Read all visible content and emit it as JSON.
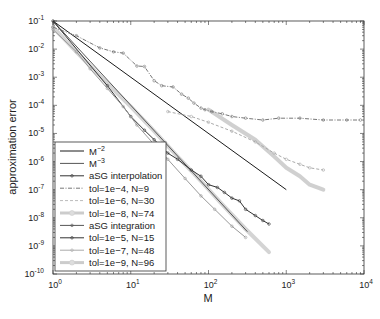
{
  "chart_data": {
    "type": "line",
    "title": "",
    "xlabel": "M",
    "ylabel": "approximation error",
    "xscale": "log",
    "yscale": "log",
    "xlim": [
      1,
      10000
    ],
    "ylim": [
      1e-10,
      0.1
    ],
    "grid": false,
    "legend_position": "lower left",
    "x_tick_labels": [
      "10^0",
      "10^1",
      "10^2",
      "10^3",
      "10^4"
    ],
    "y_tick_labels": [
      "10^-1",
      "10^-2",
      "10^-3",
      "10^-4",
      "10^-5",
      "10^-6",
      "10^-7",
      "10^-8",
      "10^-9",
      "10^-10"
    ],
    "legend": [
      "M^-2",
      "M^-3",
      "aSG interpolation",
      "tol=1e-4, N=9",
      "tol=1e-6, N=30",
      "tol=1e-8, N=74",
      "aSG integration",
      "tol=1e-5, N=15",
      "tol=1e-7, N=48",
      "tol=1e-9, N=96"
    ],
    "series": [
      {
        "name": "M^-2",
        "style": "solid",
        "color": "#1a1a1a",
        "x": [
          1,
          1000
        ],
        "y": [
          0.1,
          1e-07
        ]
      },
      {
        "name": "M^-3",
        "style": "solid",
        "color": "#555555",
        "x": [
          1,
          316
        ],
        "y": [
          0.1,
          3.2e-09
        ]
      },
      {
        "name": "aSG interpolation tol=1e-4, N=9",
        "style": "dashdot-markers",
        "color": "#777777",
        "x": [
          1,
          2,
          4,
          6,
          8,
          12,
          15,
          20,
          25,
          35,
          45,
          55,
          65,
          80,
          90,
          110,
          150,
          200,
          300,
          500,
          800,
          1500,
          3000,
          6000,
          9000
        ],
        "y": [
          0.06,
          0.03,
          0.011,
          0.008,
          0.0072,
          0.0025,
          0.0024,
          0.00075,
          0.0005,
          0.00045,
          0.00025,
          0.00018,
          0.00012,
          8e-05,
          7e-05,
          6e-05,
          5e-05,
          4e-05,
          3.5e-05,
          3e-05,
          3.5e-05,
          3.5e-05,
          3e-05,
          3e-05,
          3e-05
        ]
      },
      {
        "name": "aSG interpolation tol=1e-6, N=30",
        "style": "dashed-markers",
        "color": "#aaaaaa",
        "x": [
          30,
          60,
          100,
          200,
          400,
          700,
          1000,
          1500,
          2000,
          3000
        ],
        "y": [
          6e-05,
          4e-05,
          2.5e-05,
          1.2e-05,
          5e-06,
          2e-06,
          1.2e-06,
          8e-07,
          6e-07,
          5e-07
        ]
      },
      {
        "name": "aSG interpolation tol=1e-8, N=74",
        "style": "thick-light",
        "color": "#c8c8c8",
        "x": [
          100,
          200,
          400,
          700,
          1000,
          1500,
          2000,
          3000
        ],
        "y": [
          7e-05,
          2e-05,
          6e-06,
          1.5e-06,
          6e-07,
          3e-07,
          1.5e-07,
          1e-07
        ]
      },
      {
        "name": "aSG integration tol=1e-5, N=15",
        "style": "solid-markers",
        "color": "#333333",
        "x": [
          1,
          5,
          10,
          15,
          20,
          30,
          40,
          60,
          80,
          100,
          130,
          160,
          200,
          250,
          300,
          400,
          500,
          600
        ],
        "y": [
          0.1,
          0.0005,
          4e-05,
          1.3e-05,
          6e-06,
          2e-06,
          1.2e-06,
          5e-07,
          3e-07,
          1.5e-07,
          1.2e-07,
          8e-08,
          5e-08,
          4e-08,
          2e-08,
          1.2e-08,
          8e-09,
          6e-09
        ]
      },
      {
        "name": "aSG integration tol=1e-7, N=48",
        "style": "solid-markers",
        "color": "#999999",
        "x": [
          1,
          2,
          3,
          5,
          8,
          12,
          20,
          30,
          50,
          80,
          120,
          200,
          300
        ],
        "y": [
          0.05,
          0.008,
          0.002,
          0.0004,
          9e-05,
          2e-05,
          4e-06,
          1.2e-06,
          2.5e-07,
          6e-08,
          2e-08,
          5e-09,
          2e-09
        ]
      },
      {
        "name": "aSG integration tol=1e-9, N=96",
        "style": "thick-light",
        "color": "#cccccc",
        "x": [
          1,
          2,
          5,
          10,
          20,
          40,
          80,
          150,
          300,
          600
        ],
        "y": [
          0.06,
          0.008,
          0.0006,
          9e-05,
          1.2e-05,
          1.5e-06,
          2e-07,
          3e-08,
          4e-09,
          6e-10
        ]
      }
    ]
  }
}
